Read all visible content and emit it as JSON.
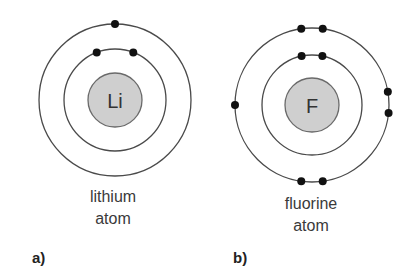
{
  "atoms": [
    {
      "id": "lithium",
      "symbol": "Li",
      "name_line1": "lithium",
      "name_line2": "atom",
      "panel": "a)",
      "center": [
        115,
        100
      ],
      "nucleus_radius": 27,
      "shells": [
        {
          "radius": 51,
          "electrons_deg": [
            -111,
            -69
          ]
        },
        {
          "radius": 76,
          "electrons_deg": [
            -90
          ]
        }
      ],
      "label_pos": [
        113,
        186
      ],
      "panel_pos": [
        32,
        249
      ]
    },
    {
      "id": "fluorine",
      "symbol": "F",
      "name_line1": "fluorine",
      "name_line2": "atom",
      "panel": "b)",
      "center": [
        312,
        105
      ],
      "nucleus_radius": 27,
      "shells": [
        {
          "radius": 50,
          "electrons_deg": [
            -102,
            -78
          ]
        },
        {
          "radius": 77,
          "electrons_deg": [
            -98,
            -82,
            180,
            -10,
            6,
            98,
            82
          ]
        }
      ],
      "label_pos": [
        311,
        193
      ],
      "panel_pos": [
        233,
        249
      ]
    }
  ],
  "colors": {
    "orbit": "#4a4a4a",
    "nucleus_fill": "#cfcfcf",
    "electron": "#111111"
  },
  "electron_radius": 4
}
